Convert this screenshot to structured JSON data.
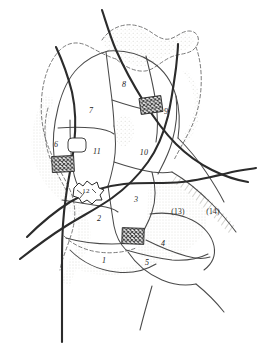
{
  "figure": {
    "kind": "scanned-line-map",
    "background_color": "#ffffff",
    "line_color": "#2b2b2b",
    "thin_line_color": "#4a4a4a",
    "dash_color": "#6b6b6b",
    "shade_color": "#e9e9e4",
    "hatch_color": "#3a3a3a",
    "width": 262,
    "height": 348
  },
  "parcel_labels": [
    {
      "id": "parcel-1",
      "text": "1",
      "x": 104,
      "y": 260,
      "style": "plain"
    },
    {
      "id": "parcel-2",
      "text": "2",
      "x": 99,
      "y": 218,
      "style": "plain"
    },
    {
      "id": "parcel-3",
      "text": "3",
      "x": 136,
      "y": 199,
      "style": "plain"
    },
    {
      "id": "parcel-4",
      "text": "4",
      "x": 163,
      "y": 243,
      "style": "plain"
    },
    {
      "id": "parcel-5",
      "text": "5",
      "x": 147,
      "y": 262,
      "style": "plain"
    },
    {
      "id": "parcel-6",
      "text": "6",
      "x": 56,
      "y": 144,
      "style": "plain"
    },
    {
      "id": "parcel-7",
      "text": "7",
      "x": 91,
      "y": 110,
      "style": "plain"
    },
    {
      "id": "parcel-8",
      "text": "8",
      "x": 124,
      "y": 84,
      "style": "plain"
    },
    {
      "id": "parcel-9",
      "text": "9",
      "x": 166,
      "y": 111,
      "style": "plain"
    },
    {
      "id": "parcel-10",
      "text": "10",
      "x": 144,
      "y": 152,
      "style": "plain"
    },
    {
      "id": "parcel-11",
      "text": "11",
      "x": 97,
      "y": 151,
      "style": "plain"
    },
    {
      "id": "parcel-12",
      "text": "12",
      "x": 86,
      "y": 190,
      "style": "sym"
    },
    {
      "id": "parcel-13",
      "text": "(13)",
      "x": 178,
      "y": 211,
      "style": "paren"
    },
    {
      "id": "parcel-14",
      "text": "(14)",
      "x": 213,
      "y": 211,
      "style": "paren"
    }
  ]
}
